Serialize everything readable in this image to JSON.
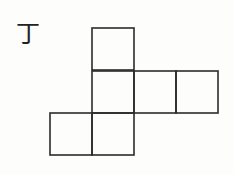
{
  "figure": {
    "label": "丁",
    "stroke_color": "#2b2b2b",
    "background": "#fdfdfc",
    "grid_origin": [
      50,
      28
    ],
    "cell_size": 42,
    "cells": [
      {
        "row": 0,
        "col": 1
      },
      {
        "row": 1,
        "col": 1
      },
      {
        "row": 1,
        "col": 2
      },
      {
        "row": 1,
        "col": 3
      },
      {
        "row": 2,
        "col": 0
      },
      {
        "row": 2,
        "col": 1
      }
    ]
  }
}
